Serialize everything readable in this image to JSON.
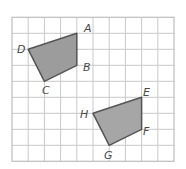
{
  "diagram": {
    "type": "coordinate-grid-translation",
    "grid": {
      "columns": 10,
      "rows": 9,
      "origin_px": [
        12,
        17.3
      ],
      "cell_w_px": 16.2,
      "cell_h_px": 16,
      "line_color": "#c9c9c9"
    },
    "figures": [
      {
        "name": "ABCD",
        "fill": "#9c9c9c",
        "stroke": "#555555",
        "vertices": [
          {
            "label": "A",
            "grid": [
              4,
              1
            ],
            "label_px": [
              84,
              32
            ]
          },
          {
            "label": "B",
            "grid": [
              4,
              3
            ],
            "label_px": [
              83,
              71
            ]
          },
          {
            "label": "C",
            "grid": [
              2,
              4
            ],
            "label_px": [
              42,
              94
            ]
          },
          {
            "label": "D",
            "grid": [
              1,
              2
            ],
            "label_px": [
              17,
              53
            ]
          }
        ]
      },
      {
        "name": "EFGH",
        "fill": "#a6a6a6",
        "stroke": "#555555",
        "vertices": [
          {
            "label": "E",
            "grid": [
              8,
              5
            ],
            "label_px": [
              143,
              96
            ]
          },
          {
            "label": "F",
            "grid": [
              8,
              7
            ],
            "label_px": [
              143,
              135
            ]
          },
          {
            "label": "G",
            "grid": [
              6,
              8
            ],
            "label_px": [
              104,
              159
            ]
          },
          {
            "label": "H",
            "grid": [
              5,
              6
            ],
            "label_px": [
              80,
              118
            ]
          }
        ]
      }
    ]
  }
}
